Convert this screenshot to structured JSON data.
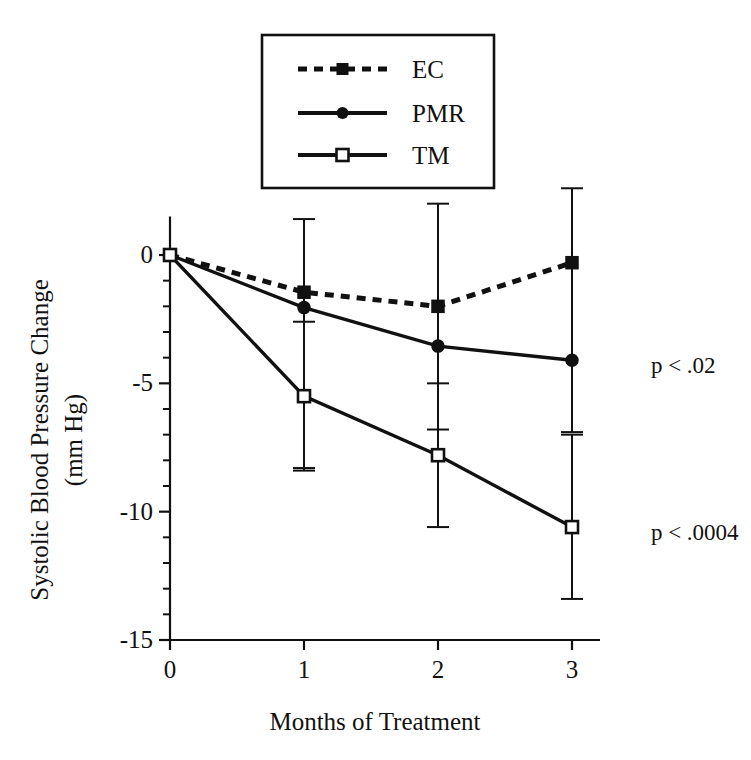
{
  "chart_data": {
    "type": "line",
    "title": "",
    "xlabel": "Months of Treatment",
    "ylabel_line1": "Systolic Blood Pressure Change",
    "ylabel_line2": "(mm Hg)",
    "x": [
      0,
      1,
      2,
      3
    ],
    "xlim": [
      0,
      3.2
    ],
    "ylim": [
      -15,
      1.5
    ],
    "xticks": [
      "0",
      "1",
      "2",
      "3"
    ],
    "yticks": [
      "0",
      "-5",
      "-10",
      "-15"
    ],
    "ytick_values": [
      0,
      -5,
      -10,
      -15
    ],
    "yminor_step": 1,
    "grid": false,
    "legend_position": "top-center",
    "series": [
      {
        "name": "EC",
        "style": "dashed",
        "marker": "filled-square",
        "values": [
          0,
          -1.45,
          -2.0,
          -0.3
        ],
        "err_low": [
          0,
          -8.3,
          -6.8,
          -6.9
        ],
        "err_high": [
          0,
          1.4,
          2.0,
          2.6
        ]
      },
      {
        "name": "PMR",
        "style": "solid",
        "marker": "filled-circle",
        "values": [
          0,
          -2.05,
          -3.55,
          -4.1
        ],
        "err_low": [
          0,
          -8.3,
          -6.8,
          -6.9
        ],
        "err_high": [
          0,
          1.4,
          2.0,
          2.6
        ]
      },
      {
        "name": "TM",
        "style": "solid",
        "marker": "open-square",
        "values": [
          0,
          -5.5,
          -7.8,
          -10.6
        ],
        "err_low": [
          0,
          -8.4,
          -10.6,
          -13.4
        ],
        "err_high": [
          0,
          -2.6,
          -5.0,
          -7.0
        ]
      }
    ],
    "annotations": [
      {
        "text": "p < .02",
        "x": 3.35,
        "y": -4.6
      },
      {
        "text": "p < .0004",
        "x": 3.35,
        "y": -11.1
      }
    ]
  },
  "legend": {
    "items": [
      {
        "label": "EC"
      },
      {
        "label": "PMR"
      },
      {
        "label": "TM"
      }
    ]
  }
}
